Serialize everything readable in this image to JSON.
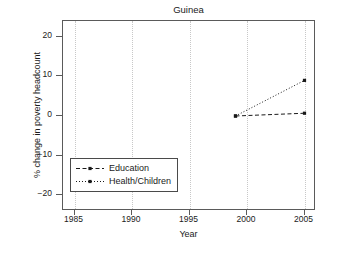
{
  "chart_data": {
    "type": "line",
    "title": "Guinea",
    "xlabel": "Year",
    "ylabel": "% change in poverty headcount",
    "xlim": [
      1984,
      2006
    ],
    "ylim": [
      -24,
      24
    ],
    "xticks": [
      1985,
      1990,
      1995,
      2000,
      2005
    ],
    "xticklabels": [
      "1985",
      "1990",
      "1995",
      "2000",
      "2005"
    ],
    "yticks": [
      20,
      10,
      0,
      -10,
      -20
    ],
    "yticklabels": [
      "20",
      "10",
      "0",
      "−10",
      "−20"
    ],
    "grid": "vertical-dotted",
    "legend_position": "lower-left-inside",
    "series": [
      {
        "name": "Education",
        "linestyle": "dashed",
        "marker": "square",
        "color": "#1a1a1a",
        "x": [
          1999,
          2005
        ],
        "y": [
          0.0,
          0.7
        ]
      },
      {
        "name": "Health/Children",
        "linestyle": "dotted",
        "marker": "square",
        "color": "#1a1a1a",
        "x": [
          1999,
          2005
        ],
        "y": [
          0.0,
          9.0
        ]
      }
    ]
  },
  "legend": {
    "items": [
      {
        "label": "Education"
      },
      {
        "label": "Health/Children"
      }
    ]
  },
  "colors": {
    "axis": "#5a5a5a",
    "grid": "#c8c8c8",
    "series": "#1a1a1a",
    "background": "#ffffff"
  }
}
